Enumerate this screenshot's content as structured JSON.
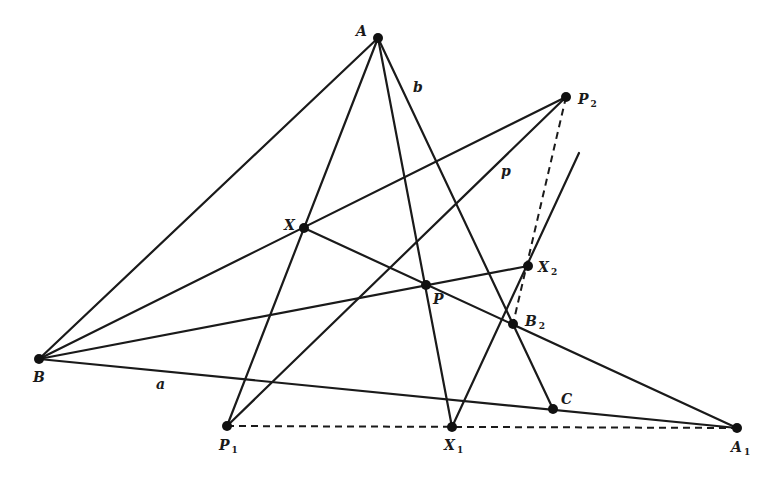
{
  "diagram": {
    "type": "projective-geometry-construction",
    "points": [
      {
        "id": "A",
        "label": "A",
        "sub": "",
        "x": 378,
        "y": 38,
        "lx": 356,
        "ly": 36
      },
      {
        "id": "P2",
        "label": "P",
        "sub": "2",
        "x": 566,
        "y": 97,
        "lx": 578,
        "ly": 104
      },
      {
        "id": "X",
        "label": "X",
        "sub": "",
        "x": 304,
        "y": 228,
        "lx": 284,
        "ly": 230
      },
      {
        "id": "P",
        "label": "P",
        "sub": "",
        "x": 426,
        "y": 285,
        "lx": 433,
        "ly": 304
      },
      {
        "id": "X2",
        "label": "X",
        "sub": "2",
        "x": 528,
        "y": 266,
        "lx": 538,
        "ly": 272
      },
      {
        "id": "B2",
        "label": "B",
        "sub": "2",
        "x": 513,
        "y": 324,
        "lx": 525,
        "ly": 326
      },
      {
        "id": "B",
        "label": "B",
        "sub": "",
        "x": 39,
        "y": 359,
        "lx": 33,
        "ly": 382
      },
      {
        "id": "C",
        "label": "C",
        "sub": "",
        "x": 553,
        "y": 409,
        "lx": 561,
        "ly": 404
      },
      {
        "id": "P1",
        "label": "P",
        "sub": "1",
        "x": 227,
        "y": 426,
        "lx": 219,
        "ly": 450
      },
      {
        "id": "X1",
        "label": "X",
        "sub": "1",
        "x": 452,
        "y": 427,
        "lx": 444,
        "ly": 450
      },
      {
        "id": "A1",
        "label": "A",
        "sub": "1",
        "x": 737,
        "y": 428,
        "lx": 731,
        "ly": 452
      }
    ],
    "line_labels": [
      {
        "id": "line-a",
        "text": "a",
        "x": 156,
        "y": 389
      },
      {
        "id": "line-b",
        "text": "b",
        "x": 413,
        "y": 92
      },
      {
        "id": "line-p",
        "text": "p",
        "x": 501,
        "y": 176
      }
    ],
    "solid_segments": [
      [
        "A",
        "B"
      ],
      [
        "A",
        "P1"
      ],
      [
        "A",
        "X1"
      ],
      [
        "A",
        "C"
      ],
      [
        "B",
        "P2"
      ],
      [
        "B",
        "X2"
      ],
      [
        "B",
        "A1"
      ],
      [
        "X",
        "A1"
      ],
      [
        "P2",
        "P1"
      ],
      [
        "X1",
        "EXT"
      ]
    ],
    "extra_points": {
      "EXT": {
        "x": 579,
        "y": 153
      }
    },
    "dashed_segments": [
      [
        "P1",
        "A1"
      ],
      [
        "P2",
        "B2"
      ]
    ]
  }
}
